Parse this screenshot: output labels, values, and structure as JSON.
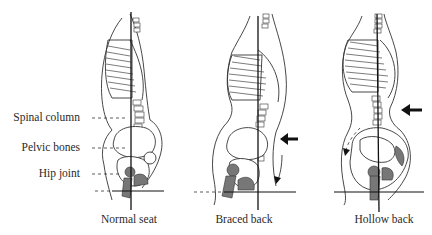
{
  "figure": {
    "side_labels": [
      {
        "id": "spinal-column",
        "text": "Spinal column"
      },
      {
        "id": "pelvic-bones",
        "text": "Pelvic bones"
      },
      {
        "id": "hip-joint",
        "text": "Hip joint"
      }
    ],
    "panels": [
      {
        "id": "normal-seat",
        "caption": "Normal seat"
      },
      {
        "id": "braced-back",
        "caption": "Braced back"
      },
      {
        "id": "hollow-back",
        "caption": "Hollow back"
      }
    ]
  },
  "colors": {
    "ink": "#222222",
    "background": "#ffffff",
    "shade": "#777777"
  }
}
